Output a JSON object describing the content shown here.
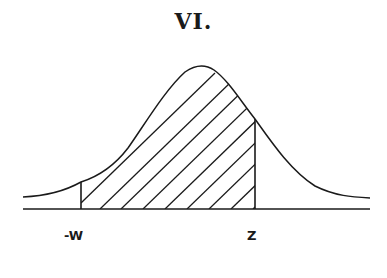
{
  "figure": {
    "title": "VI.",
    "type": "normal-distribution-curve",
    "shaded_region": "between -w and z",
    "shading_style": "diagonal hatching"
  },
  "labels": {
    "left_bound": "-W",
    "right_bound": "Z"
  },
  "colors": {
    "ink": "#1a1a1a",
    "background": "#ffffff"
  }
}
